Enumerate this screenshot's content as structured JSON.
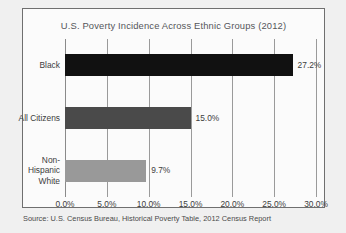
{
  "chart_data": {
    "type": "bar",
    "orientation": "horizontal",
    "title": "U.S. Poverty Incidence Across Ethnic Groups (2012)",
    "xlabel": "",
    "ylabel": "",
    "xlim": [
      0,
      30
    ],
    "grid": true,
    "legend": "none",
    "categories": [
      "Black",
      "All Citizens",
      "Non-\nHispanic\nWhite"
    ],
    "values": [
      27.2,
      15.0,
      9.7
    ],
    "bars": [
      {
        "category": "Black",
        "label_lines": [
          "Black"
        ],
        "value": 27.2,
        "value_label": "27.2%",
        "color": "#111111"
      },
      {
        "category": "All Citizens",
        "label_lines": [
          "All Citizens"
        ],
        "value": 15.0,
        "value_label": "15.0%",
        "color": "#4a4a4a"
      },
      {
        "category": "Non-Hispanic White",
        "label_lines": [
          "Non-",
          "Hispanic",
          "White"
        ],
        "value": 9.7,
        "value_label": "9.7%",
        "color": "#999999"
      }
    ],
    "xticks": [
      0,
      5,
      10,
      15,
      20,
      25,
      30
    ],
    "xtick_labels": [
      "0.0%",
      "5.0%",
      "10.0%",
      "15.0%",
      "20.0%",
      "25.0%",
      "30.0%"
    ]
  },
  "source_note": "Source: U.S. Census Bureau, Historical Poverty Table, 2012 Census Report",
  "colors": {
    "page_background": "#f0f0f0",
    "plot_background": "#fbfbfb",
    "frame_border": "#6f6f6f",
    "gridline": "#9a9a9a",
    "text": "#3d3d3d",
    "title_text": "#55565a"
  }
}
